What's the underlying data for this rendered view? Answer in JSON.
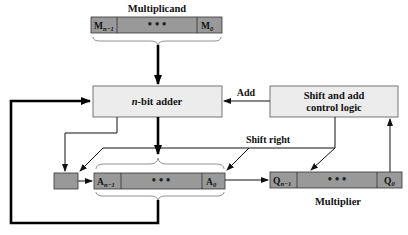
{
  "labels": {
    "multiplicand": "Multiplicand",
    "adder": "n-bit adder",
    "adder_italic": "n",
    "adder_rest": "-bit adder",
    "control_line1": "Shift and add",
    "control_line2": "control logic",
    "add_signal": "Add",
    "shift_signal": "Shift right",
    "multiplier": "Multiplier"
  },
  "registers": {
    "M": {
      "msb": "M",
      "msb_sub": "n−1",
      "lsb": "M",
      "lsb_sub": "0",
      "ellipsis": "•   •   •"
    },
    "A": {
      "msb": "A",
      "msb_sub": "n−1",
      "lsb": "A",
      "lsb_sub": "0",
      "ellipsis": "•   •   •"
    },
    "Q": {
      "msb": "Q",
      "msb_sub": "n−1",
      "lsb": "Q",
      "lsb_sub": "0",
      "ellipsis": "•   •   •"
    },
    "C": {
      "label": ""
    }
  },
  "colors": {
    "register_fill": "#999999",
    "box_fill": "#ececec",
    "line": "#000000"
  }
}
